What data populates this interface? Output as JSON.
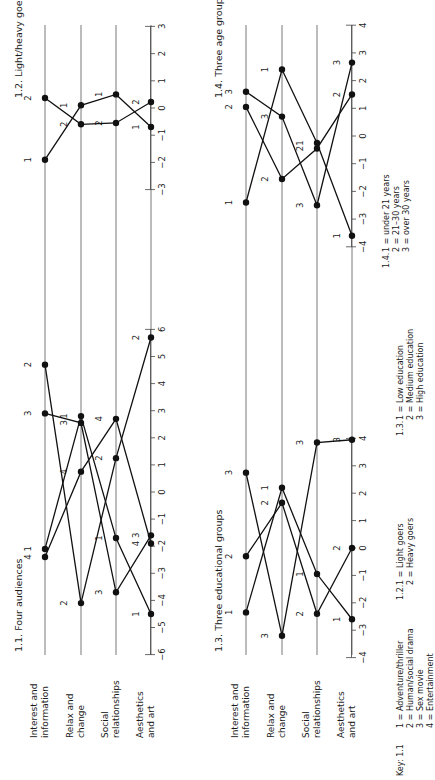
{
  "categories": [
    "Interest and information",
    "Relax and change",
    "Social relationships",
    "Aesthetics and art"
  ],
  "category_lines": [
    [
      "Interest and",
      "information"
    ],
    [
      "Relax and",
      "change"
    ],
    [
      "Social",
      "relationships"
    ],
    [
      "Aesthetics",
      "and art"
    ]
  ],
  "key": {
    "label": "Key:",
    "groups": [
      {
        "id": "1.1",
        "lines": [
          "1  = Adventure/thriller",
          "2 = Human/social drama",
          "3 = Sex movie",
          "4 = Entertainment"
        ]
      },
      {
        "id": "1.2.",
        "lines": [
          "1 = Light goers",
          "2 = Heavy goers"
        ]
      },
      {
        "id": "1.3.",
        "lines": [
          "1 = Low education",
          "2 = Medium education",
          "3 = High education"
        ]
      },
      {
        "id": "1.4.",
        "lines": [
          "1 = under 21 years",
          "2 = 21–30 years",
          "3 = over 30 years"
        ]
      }
    ]
  },
  "chart_data": [
    {
      "type": "line",
      "title": "1.1. Four audiences",
      "categories": [
        "Interest and information",
        "Relax and change",
        "Social relationships",
        "Aesthetics and art"
      ],
      "ticks": [
        -6,
        -5,
        -4,
        -3,
        -2,
        -1,
        0,
        1,
        2,
        3,
        4,
        5,
        6
      ],
      "ylim": [
        -6,
        6
      ],
      "series": [
        {
          "name": "1",
          "label": "Adventure/thriller",
          "values": [
            -2.1,
            2.8,
            -1.7,
            -4.5
          ]
        },
        {
          "name": "2",
          "label": "Human/social drama",
          "values": [
            4.7,
            -4.1,
            1.25,
            5.7
          ]
        },
        {
          "name": "3",
          "label": "Sex movie",
          "values": [
            2.9,
            2.55,
            -3.7,
            -1.6
          ]
        },
        {
          "name": "4",
          "label": "Entertainment",
          "values": [
            -2.4,
            0.75,
            2.7,
            -1.9
          ]
        }
      ]
    },
    {
      "type": "line",
      "title": "1.2. Light/heavy goers",
      "categories": [
        "Interest and information",
        "Relax and change",
        "Social relationships",
        "Aesthetics and art"
      ],
      "ticks": [
        -3,
        -2,
        -1,
        0,
        1,
        2,
        3
      ],
      "ylim": [
        -3,
        3
      ],
      "series": [
        {
          "name": "1",
          "label": "Light goers",
          "values": [
            -1.9,
            0.1,
            0.5,
            -0.7
          ]
        },
        {
          "name": "2",
          "label": "Heavy goers",
          "values": [
            0.37,
            -0.6,
            -0.55,
            0.22
          ]
        }
      ]
    },
    {
      "type": "line",
      "title": "1.3. Three educational groups",
      "categories": [
        "Interest and information",
        "Relax and change",
        "Social relationships",
        "Aesthetics and art"
      ],
      "ticks": [
        -4,
        -3,
        -2,
        -1,
        0,
        1,
        2,
        3,
        4
      ],
      "ylim": [
        -4,
        4
      ],
      "series": [
        {
          "name": "1",
          "label": "Low education",
          "values": [
            -2.35,
            2.2,
            -0.95,
            -2.6
          ]
        },
        {
          "name": "2",
          "label": "Medium education",
          "values": [
            -0.3,
            1.65,
            -2.4,
            0.0
          ]
        },
        {
          "name": "3",
          "label": "High education",
          "values": [
            2.75,
            -3.2,
            3.85,
            3.95
          ]
        }
      ]
    },
    {
      "type": "line",
      "title": "1.4. Three age groups",
      "categories": [
        "Interest and information",
        "Relax and change",
        "Social relationships",
        "Aesthetics and art"
      ],
      "ticks": [
        -4,
        -3,
        -2,
        -1,
        0,
        1,
        2,
        3,
        4
      ],
      "ylim": [
        -4,
        4
      ],
      "series": [
        {
          "name": "1",
          "label": "under 21 years",
          "values": [
            -2.4,
            2.4,
            -0.25,
            -3.6
          ]
        },
        {
          "name": "2",
          "label": "21–30 years",
          "values": [
            1.05,
            -1.55,
            -0.45,
            1.5
          ]
        },
        {
          "name": "3",
          "label": "over 30 years",
          "values": [
            1.6,
            0.7,
            -2.5,
            2.65
          ]
        }
      ]
    }
  ]
}
